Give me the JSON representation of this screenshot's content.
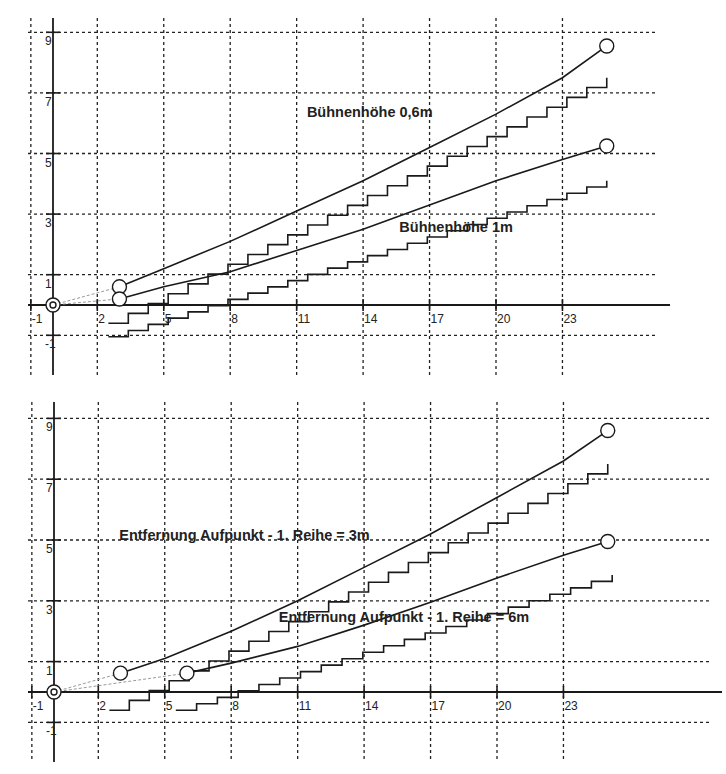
{
  "chart_data": [
    {
      "type": "line",
      "title": "",
      "xlabel": "",
      "ylabel": "",
      "xlim": [
        -1,
        27
      ],
      "ylim": [
        -2,
        9.5
      ],
      "grid": true,
      "x_ticks": [
        "-1",
        "2",
        "5",
        "8",
        "11",
        "14",
        "17",
        "20",
        "23"
      ],
      "y_ticks": [
        "9",
        "7",
        "5",
        "3",
        "1",
        "-1"
      ],
      "annotations": [
        {
          "text": "Bühnenhöhe 0,6m",
          "x": 14.3,
          "y": 6.2
        },
        {
          "text": "Bühnenhöhe 1m",
          "x": 18.2,
          "y": 2.4
        }
      ],
      "series": [
        {
          "name": "Sichtlinie Bühnenhöhe 0,6m",
          "kind": "sightline",
          "x": [
            3,
            5,
            8,
            11,
            14,
            17,
            20,
            23,
            25
          ],
          "y": [
            0.6,
            1.2,
            2.1,
            3.1,
            4.1,
            5.2,
            6.3,
            7.5,
            8.55
          ]
        },
        {
          "name": "Sichtlinie Bühnenhöhe 1m",
          "kind": "sightline",
          "x": [
            3,
            5,
            8,
            11,
            14,
            17,
            20,
            23,
            25
          ],
          "y": [
            0.2,
            0.6,
            1.1,
            1.8,
            2.5,
            3.3,
            4.1,
            4.8,
            5.25
          ]
        },
        {
          "name": "Reihen Bühnenhöhe 0,6m",
          "kind": "stairs",
          "x_start": 2.5,
          "x_end": 25,
          "y_start": -0.6,
          "y_end": 7.5,
          "steps": 25
        },
        {
          "name": "Reihen Bühnenhöhe 1m",
          "kind": "stairs",
          "x_start": 2.5,
          "x_end": 25,
          "y_start": -1.05,
          "y_end": 4.1,
          "steps": 25
        }
      ],
      "markers": [
        {
          "name": "Aufpunkt 1",
          "x": 3,
          "y": 0.6
        },
        {
          "name": "Aufpunkt 2",
          "x": 3,
          "y": 0.2
        },
        {
          "name": "Bühne",
          "x": 25,
          "y": 8.55
        },
        {
          "name": "Bühne",
          "x": 25,
          "y": 5.25
        },
        {
          "name": "Ursprung",
          "x": 0,
          "y": 0
        }
      ]
    },
    {
      "type": "line",
      "title": "",
      "xlabel": "",
      "ylabel": "",
      "xlim": [
        -1,
        27
      ],
      "ylim": [
        -2,
        9.5
      ],
      "grid": true,
      "x_ticks": [
        "-1",
        "2",
        "5",
        "8",
        "11",
        "14",
        "17",
        "20",
        "23"
      ],
      "y_ticks": [
        "9",
        "7",
        "5",
        "3",
        "1",
        "-1"
      ],
      "annotations": [
        {
          "text": "Entfernung Aufpunkt - 1. Reihe = 3m",
          "x": 8.6,
          "y": 5.0
        },
        {
          "text": "Entfernung Aufpunkt - 1. Reihe = 6m",
          "x": 15.8,
          "y": 2.3
        }
      ],
      "series": [
        {
          "name": "Sichtlinie Entfernung 3m",
          "kind": "sightline",
          "x": [
            3,
            5,
            8,
            11,
            14,
            17,
            20,
            23,
            25
          ],
          "y": [
            0.62,
            1.1,
            2.0,
            3.0,
            4.1,
            5.2,
            6.4,
            7.6,
            8.6
          ]
        },
        {
          "name": "Sichtlinie Entfernung 6m",
          "kind": "sightline",
          "x": [
            6,
            8,
            11,
            14,
            17,
            20,
            23,
            25
          ],
          "y": [
            0.62,
            0.95,
            1.5,
            2.2,
            2.95,
            3.75,
            4.5,
            4.95
          ]
        },
        {
          "name": "Reihen Entfernung 3m",
          "kind": "stairs",
          "x_start": 2.5,
          "x_end": 25,
          "y_start": -0.6,
          "y_end": 7.5,
          "steps": 25
        },
        {
          "name": "Reihen Entfernung 6m",
          "kind": "stairs",
          "x_start": 5.5,
          "x_end": 25.2,
          "y_start": -0.6,
          "y_end": 3.85,
          "steps": 21
        }
      ],
      "markers": [
        {
          "name": "Aufpunkt 1",
          "x": 3,
          "y": 0.62
        },
        {
          "name": "Aufpunkt 2",
          "x": 6,
          "y": 0.62
        },
        {
          "name": "Bühne",
          "x": 25,
          "y": 8.6
        },
        {
          "name": "Bühne",
          "x": 25,
          "y": 4.95
        },
        {
          "name": "Ursprung",
          "x": 0,
          "y": 0
        }
      ]
    }
  ],
  "layout": [
    {
      "ox": 53,
      "oy": 305,
      "sx": 22.15,
      "sy": 30.3,
      "top": 18,
      "bottom": 375,
      "left": 28,
      "right": 658
    },
    {
      "ox": 54,
      "oy": 692,
      "sx": 22.15,
      "sy": 30.4,
      "top": 402,
      "bottom": 762,
      "left": 28,
      "right": 710
    }
  ]
}
